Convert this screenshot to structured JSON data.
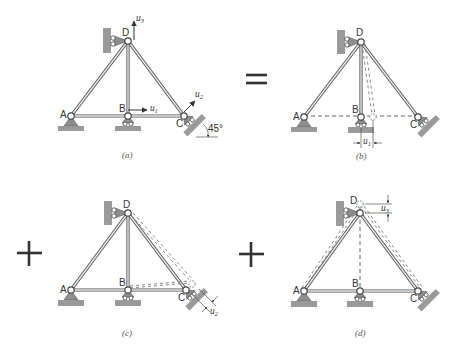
{
  "figure": {
    "panels": [
      {
        "id": "a",
        "caption": "(a)",
        "nodes": {
          "A": {
            "label": "A",
            "x": 71,
            "y": 116
          },
          "B": {
            "label": "B",
            "x": 128,
            "y": 116
          },
          "C": {
            "label": "C",
            "x": 184,
            "y": 116
          },
          "D": {
            "label": "D",
            "x": 128,
            "y": 41
          }
        },
        "annotations": {
          "u1": {
            "symbol": "u",
            "sub": "1"
          },
          "u2": {
            "symbol": "u",
            "sub": "2"
          },
          "u3": {
            "symbol": "u",
            "sub": "3"
          },
          "angle": "45°"
        }
      },
      {
        "id": "b",
        "caption": "(b)",
        "nodes": {
          "A": {
            "label": "A",
            "x": 304,
            "y": 117
          },
          "B": {
            "label": "B",
            "x": 361,
            "y": 117
          },
          "C": {
            "label": "C",
            "x": 418,
            "y": 117
          },
          "D": {
            "label": "D",
            "x": 361,
            "y": 42
          }
        },
        "annotations": {
          "u1": {
            "symbol": "u",
            "sub": "1"
          }
        }
      },
      {
        "id": "c",
        "caption": "(c)",
        "nodes": {
          "A": {
            "label": "A",
            "x": 71,
            "y": 290
          },
          "B": {
            "label": "B",
            "x": 128,
            "y": 290
          },
          "C": {
            "label": "C",
            "x": 186,
            "y": 290
          },
          "D": {
            "label": "D",
            "x": 128,
            "y": 213
          }
        },
        "annotations": {
          "u2": {
            "symbol": "u",
            "sub": "2"
          }
        }
      },
      {
        "id": "d",
        "caption": "(d)",
        "nodes": {
          "A": {
            "label": "A",
            "x": 304,
            "y": 291
          },
          "B": {
            "label": "B",
            "x": 360,
            "y": 291
          },
          "C": {
            "label": "C",
            "x": 418,
            "y": 291
          },
          "D": {
            "label": "D",
            "x": 360,
            "y": 213
          }
        },
        "annotations": {
          "u3": {
            "symbol": "u",
            "sub": "3"
          }
        }
      }
    ],
    "operators": {
      "equals": "=",
      "plus1": "+",
      "plus2": "+"
    }
  }
}
